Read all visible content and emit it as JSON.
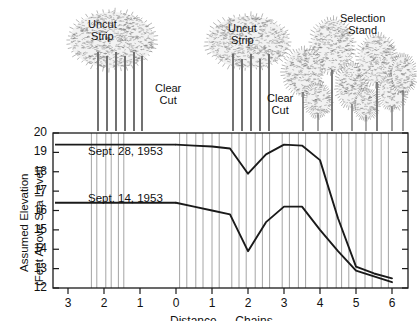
{
  "figure": {
    "canopy_labels": [
      {
        "name": "uncut-strip-left",
        "text": "Uncut\nStrip",
        "x": 88,
        "y": 18
      },
      {
        "name": "clear-cut-left",
        "text": "Clear\nCut",
        "x": 155,
        "y": 82
      },
      {
        "name": "uncut-strip-right",
        "text": "Uncut\nStrip",
        "x": 228,
        "y": 22
      },
      {
        "name": "clear-cut-right",
        "text": "Clear\nCut",
        "x": 267,
        "y": 92
      },
      {
        "name": "selection-stand",
        "text": "Selection\nStand",
        "x": 340,
        "y": 12
      }
    ],
    "series_annotations": [
      {
        "name": "label-sept-28",
        "text": "Sept. 28, 1953",
        "x": 88,
        "y": 145
      },
      {
        "name": "label-sept-14",
        "text": "Sept. 14, 1953",
        "x": 88,
        "y": 192
      }
    ]
  },
  "chart_data": {
    "type": "line",
    "title": "",
    "xlabel": "Distance — Chains",
    "ylabel": "Assumed Elevation\n(Feet Above Sea Level)",
    "ylabel_line1": "Assumed Elevation",
    "ylabel_line2": "(Feet Above Sea Level)",
    "xlim": [
      -3.4,
      6.2
    ],
    "ylim": [
      12,
      20
    ],
    "grid": "vertical-tree-positions",
    "legend": "inline-annotations",
    "y_ticks": [
      12,
      13,
      14,
      15,
      16,
      17,
      18,
      19,
      20
    ],
    "x_ticks": [
      {
        "value": -3,
        "label": "3"
      },
      {
        "value": -2,
        "label": "2"
      },
      {
        "value": -1,
        "label": "1"
      },
      {
        "value": 0,
        "label": "0"
      },
      {
        "value": 1,
        "label": "1"
      },
      {
        "value": 2,
        "label": "2"
      },
      {
        "value": 3,
        "label": "3"
      },
      {
        "value": 4,
        "label": "4"
      },
      {
        "value": 5,
        "label": "5"
      },
      {
        "value": 6,
        "label": "6"
      }
    ],
    "series": [
      {
        "name": "Sept. 28, 1953",
        "x": [
          0,
          0.5,
          1.0,
          1.5,
          2.0,
          2.5,
          3.0,
          3.5,
          4.0,
          4.5,
          5.0,
          5.5,
          6.0
        ],
        "values": [
          19.4,
          19.35,
          19.3,
          19.2,
          17.9,
          18.9,
          19.4,
          19.35,
          18.6,
          15.6,
          13.1,
          12.75,
          12.5
        ]
      },
      {
        "name": "Sept. 14, 1953",
        "x": [
          0,
          0.5,
          1.0,
          1.5,
          2.0,
          2.5,
          3.0,
          3.5,
          4.0,
          4.5,
          5.0,
          5.5,
          6.0
        ],
        "values": [
          16.4,
          16.2,
          16.0,
          15.8,
          13.9,
          15.4,
          16.2,
          16.2,
          15.0,
          13.9,
          12.9,
          12.6,
          12.3
        ]
      }
    ],
    "tree_gridlines": [
      -2.35,
      -2.2,
      -1.95,
      -1.8,
      -1.6,
      -1.45,
      0.1,
      0.3,
      0.55,
      0.75,
      1.0,
      1.2,
      1.55,
      1.75,
      1.95,
      2.2,
      2.4,
      2.6,
      2.95,
      3.15,
      3.4,
      3.6,
      4.0,
      4.2,
      4.45,
      4.6,
      4.8,
      5.0,
      5.25,
      5.45,
      5.7,
      5.9
    ],
    "colors": {
      "curve": "#1a1a1a",
      "axis": "#1a1a1a",
      "gridline": "#9a9a9a",
      "tree": "#6b6b6b"
    }
  }
}
